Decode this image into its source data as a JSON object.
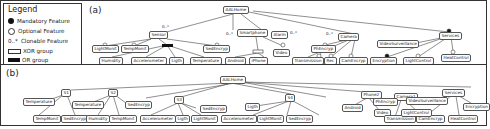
{
  "legend": {
    "title": "Legend",
    "items": [
      {
        "symbol": "filled-circle",
        "label": "Mandatory Feature"
      },
      {
        "symbol": "empty-circle",
        "label": "Optional Feature"
      },
      {
        "symbol": "0..*",
        "label": "Clonable Feature"
      },
      {
        "symbol": "empty-rect",
        "label": "XOR group"
      },
      {
        "symbol": "filled-rect",
        "label": "OR group"
      }
    ]
  },
  "panel_a": {
    "label": "(a)",
    "nodes": {
      "root": "AALHome",
      "sensor": "Sensor",
      "smartphone": "Smartphone",
      "alarm": "Alarm",
      "camera": "Camera",
      "services": "Services",
      "lightmonit": "LightMonit",
      "tempmonit": "TempMonit",
      "sedencryp": "SedEncryp",
      "humidity": "Humidity",
      "accelerometer": "Accelerometer",
      "ligth": "Ligth",
      "temperature": "Temperature",
      "android": "Android",
      "iphone": "iPhone",
      "video": "Video",
      "phencryp": "PhEncryp",
      "transmission": "Transmission",
      "rec": "Rec",
      "camencryp": "CamEncryp",
      "videosurveillance": "VideoSurveillance",
      "encryption": "Encryption",
      "lightcontrol": "LightControl",
      "heatcontrol": "HeatControl"
    },
    "cardinalities": {
      "sensor": "0..*",
      "smartphone": "0..*",
      "alarm": "0..*",
      "camera": "0..*"
    }
  },
  "panel_b": {
    "label": "(b)",
    "nodes": {
      "root": "AALHome",
      "s1a": "S1",
      "s1b": "S2",
      "s1c": "S3",
      "s4": "S4",
      "phone2": "Phone2",
      "camera1": "Camera1",
      "services": "Services",
      "temp1": "Temperature",
      "tempmonit1": "TempMonit",
      "sedencryp1": "SedEncryp",
      "temp2": "Temperature",
      "humidity2": "Humidity",
      "tempmonit2": "TempMonit",
      "sedencryp2": "SedEncryp",
      "accel3": "Accelerometer",
      "ligth3": "Ligth",
      "lightmonit3": "LightMonit",
      "sedencryp3": "SedEncryp",
      "ligth4": "Ligth",
      "accel4": "Accelerometer",
      "lightmonit4": "LightMonit",
      "sedencryp4": "SedEncryp",
      "android": "Android",
      "video": "Video",
      "phencryp": "PhEncryp",
      "transmission": "Transmission",
      "camencryp": "CamEncryp",
      "videosurveillance": "VideoSurveillance",
      "lightcontrol": "LightControl",
      "heatcontrol": "HeatControl",
      "encryption": "Encryption"
    }
  }
}
